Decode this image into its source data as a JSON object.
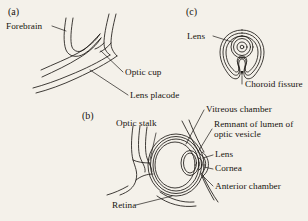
{
  "figure": {
    "background_color": "#f4f1ea",
    "ink_color": "#1d1a17"
  },
  "panels": [
    {
      "id": "a",
      "tag": "(a)",
      "stage": "optic vesicle contacting surface ectoderm",
      "labels": [
        {
          "name": "forebrain",
          "text": "Forebrain"
        },
        {
          "name": "optic-cup",
          "text": "Optic cup"
        },
        {
          "name": "lens-placode",
          "text": "Lens placode"
        }
      ]
    },
    {
      "id": "b",
      "tag": "(b)",
      "stage": "optic cup with lens vesicle",
      "labels": [
        {
          "name": "optic-stalk",
          "text": "Optic stalk"
        },
        {
          "name": "vitreous-chamber",
          "text": "Vitreous chamber"
        },
        {
          "name": "remnant-of-lumen",
          "text": "Remnant of lumen of optic vesicle"
        },
        {
          "name": "lens",
          "text": "Lens"
        },
        {
          "name": "cornea",
          "text": "Cornea"
        },
        {
          "name": "anterior-chamber",
          "text": "Anterior chamber"
        },
        {
          "name": "retina",
          "text": "Retina"
        }
      ]
    },
    {
      "id": "c",
      "tag": "(c)",
      "stage": "ventral view of optic cup showing choroid fissure",
      "labels": [
        {
          "name": "lens",
          "text": "Lens"
        },
        {
          "name": "choroid-fissure",
          "text": "Choroid fissure"
        }
      ]
    }
  ]
}
